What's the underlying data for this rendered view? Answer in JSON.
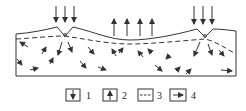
{
  "diagram": {
    "type": "groundwater-flow-cross-section",
    "colors": {
      "line": "#333333",
      "background": "#ffffff"
    },
    "recharge_zones": [
      {
        "name": "left-recharge",
        "arrow_count": 3,
        "direction": "down"
      },
      {
        "name": "right-recharge",
        "arrow_count": 3,
        "direction": "down"
      }
    ],
    "discharge_zone": {
      "name": "middle-discharge",
      "arrow_count": 4,
      "direction": "up"
    }
  },
  "legend": {
    "items": [
      {
        "label": "1",
        "symbol": "down-arrow-box"
      },
      {
        "label": "2",
        "symbol": "up-arrow-box"
      },
      {
        "label": "3",
        "symbol": "dashed-line-box"
      },
      {
        "label": "4",
        "symbol": "right-arrow-box"
      }
    ]
  }
}
